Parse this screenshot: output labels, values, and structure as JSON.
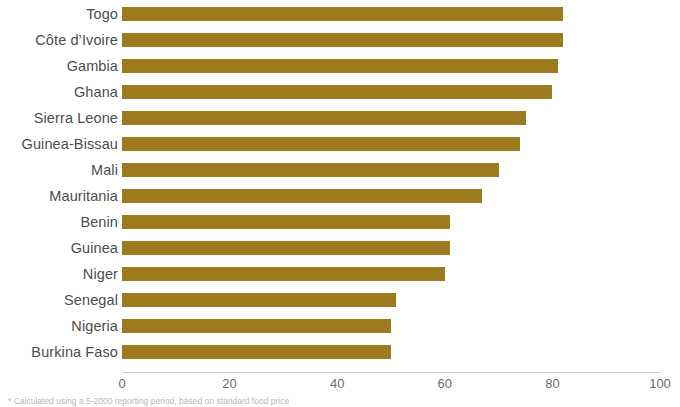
{
  "chart_data": {
    "type": "bar",
    "orientation": "horizontal",
    "title": "",
    "subtitle": "",
    "xlabel": "",
    "ylabel": "",
    "categories": [
      "Togo",
      "Côte d’Ivoire",
      "Gambia",
      "Ghana",
      "Sierra Leone",
      "Guinea-Bissau",
      "Mali",
      "Mauritania",
      "Benin",
      "Guinea",
      "Niger",
      "Senegal",
      "Nigeria",
      "Burkina Faso"
    ],
    "values": [
      82,
      82,
      81,
      80,
      75,
      74,
      70,
      67,
      61,
      61,
      60,
      51,
      50,
      50
    ],
    "xlim": [
      0,
      100
    ],
    "xticks": [
      0,
      20,
      40,
      60,
      80,
      100
    ],
    "xtick_labels": [
      "0",
      "20",
      "40",
      "60",
      "80",
      "100"
    ],
    "grid": false,
    "legend": null,
    "bar_color": "#9c7a1e",
    "label_color": "#4d4d4d",
    "tick_color": "#6b6b6b",
    "axis_color": "#c9c9c9",
    "background": "#ffffff"
  },
  "footnote": {
    "text": "* Calculated using a 5-2000 reporting period, based on standard food price"
  }
}
